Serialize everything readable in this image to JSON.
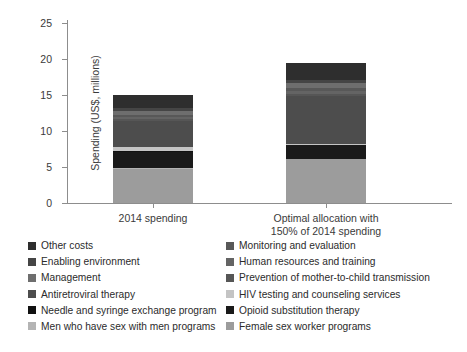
{
  "chart_data": {
    "type": "bar",
    "stacked": true,
    "title": "",
    "xlabel": "",
    "ylabel": "Spending (US$, millions)",
    "ylim": [
      0,
      25
    ],
    "yticks": [
      0,
      5,
      10,
      15,
      20,
      25
    ],
    "grid": false,
    "legend_position": "bottom",
    "categories": [
      "2014 spending",
      "Optimal allocation with 150% of 2014 spending"
    ],
    "category_lines": [
      [
        "2014 spending"
      ],
      [
        "Optimal allocation with",
        "150% of 2014 spending"
      ]
    ],
    "totals": [
      15.0,
      19.4
    ],
    "series": [
      {
        "name": "Female sex worker programs",
        "color": "#9c9c9c",
        "values": [
          4.75,
          6.05
        ]
      },
      {
        "name": "Men who have sex with men programs",
        "color": "#b4b4b4",
        "values": [
          0.05,
          0.1
        ]
      },
      {
        "name": "Opioid substitution therapy",
        "color": "#1a1a1a",
        "values": [
          2.35,
          1.85
        ]
      },
      {
        "name": "Needle and syringe exchange program",
        "color": "#111111",
        "values": [
          0.05,
          0.05
        ]
      },
      {
        "name": "HIV testing and counseling services",
        "color": "#c4c4c4",
        "values": [
          0.55,
          0.15
        ]
      },
      {
        "name": "Antiretroviral therapy",
        "color": "#4d4d4d",
        "values": [
          3.65,
          6.6
        ]
      },
      {
        "name": "Prevention of mother-to-child transmission",
        "color": "#565656",
        "values": [
          0.25,
          0.35
        ]
      },
      {
        "name": "Human resources and training",
        "color": "#646464",
        "values": [
          0.3,
          0.45
        ]
      },
      {
        "name": "Monitoring and evaluation",
        "color": "#585858",
        "values": [
          0.3,
          0.4
        ]
      },
      {
        "name": "Management",
        "color": "#6e6e6e",
        "values": [
          0.55,
          0.7
        ]
      },
      {
        "name": "Enabling environment",
        "color": "#454545",
        "values": [
          0.35,
          0.45
        ]
      },
      {
        "name": "Other costs",
        "color": "#2e2e2e",
        "values": [
          1.85,
          2.25
        ]
      }
    ]
  },
  "axis": {
    "y_label": "Spending (US$, millions)",
    "y_ticks": [
      "25",
      "20",
      "15",
      "10",
      "5",
      "0"
    ],
    "x_labels": [
      {
        "line1": "2014 spending",
        "line2": ""
      },
      {
        "line1": "Optimal allocation with",
        "line2": "150% of 2014 spending"
      }
    ]
  },
  "legend": {
    "column_left": [
      {
        "label": "Other costs",
        "color": "#2e2e2e"
      },
      {
        "label": "Enabling environment",
        "color": "#454545"
      },
      {
        "label": "Management",
        "color": "#6e6e6e"
      },
      {
        "label": "Antiretroviral therapy",
        "color": "#4d4d4d"
      },
      {
        "label": "Needle and syringe exchange program",
        "color": "#111111"
      },
      {
        "label": "Men who have sex with men programs",
        "color": "#b4b4b4"
      }
    ],
    "column_right": [
      {
        "label": "Monitoring and evaluation",
        "color": "#585858"
      },
      {
        "label": "Human resources and training",
        "color": "#646464"
      },
      {
        "label": "Prevention of mother-to-child transmission",
        "color": "#565656"
      },
      {
        "label": "HIV testing and counseling services",
        "color": "#c4c4c4"
      },
      {
        "label": "Opioid substitution therapy",
        "color": "#1a1a1a"
      },
      {
        "label": "Female sex worker programs",
        "color": "#9c9c9c"
      }
    ]
  }
}
